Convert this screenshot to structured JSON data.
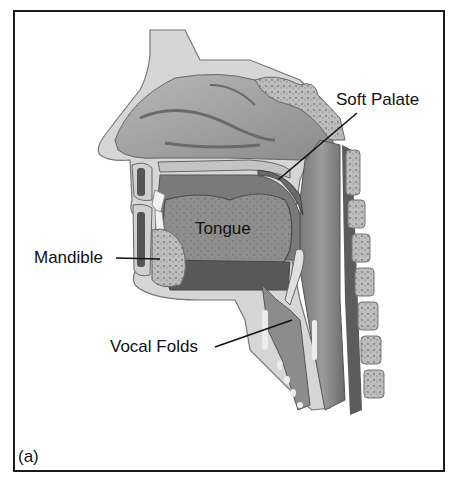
{
  "figure": {
    "type": "anatomical-sagittal-section",
    "panel_label": "(a)",
    "labels": {
      "soft_palate": "Soft Palate",
      "tongue": "Tongue",
      "mandible": "Mandible",
      "vocal_folds": "Vocal Folds"
    }
  },
  "colors": {
    "frame": "#1a1a1a",
    "background": "#ffffff",
    "tissue_light": "#d2d2d2",
    "tissue_mid": "#9a9a9a",
    "tissue_dark": "#5e5e5e",
    "bone": "#c8c8c8",
    "leader_line": "#111111"
  }
}
